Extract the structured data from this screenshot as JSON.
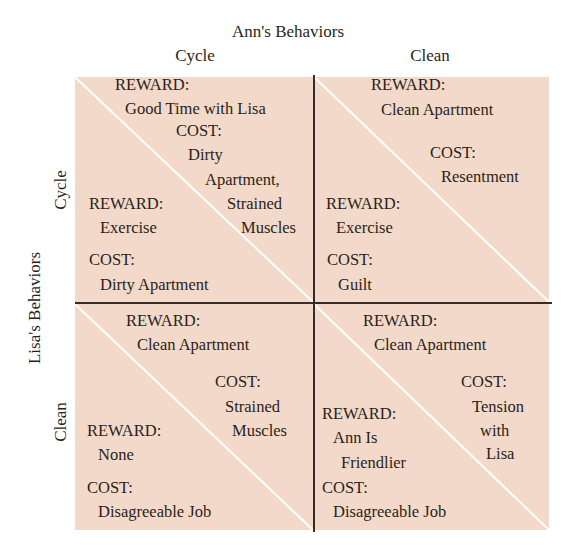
{
  "title": "Ann's Behaviors",
  "columns": [
    "Cycle",
    "Clean"
  ],
  "row_axis_title": "Lisa's Behaviors",
  "rows": [
    "Cycle",
    "Clean"
  ],
  "colors": {
    "cell_background": "#f3d9c9",
    "grid_line": "#3a2c25",
    "diagonal": "#ffffff",
    "text": "#2a1f1a"
  },
  "cells": {
    "cycle_cycle": {
      "ann": {
        "reward_label": "REWARD:",
        "reward": "Good Time with Lisa",
        "cost_label": "COST:",
        "cost_lines": [
          "Dirty",
          "Apartment,",
          "Strained",
          "Muscles"
        ]
      },
      "lisa": {
        "reward_label": "REWARD:",
        "reward": "Exercise",
        "cost_label": "COST:",
        "cost": "Dirty Apartment"
      }
    },
    "cycle_clean": {
      "ann": {
        "reward_label": "REWARD:",
        "reward": "Clean Apartment",
        "cost_label": "COST:",
        "cost": "Resentment"
      },
      "lisa": {
        "reward_label": "REWARD:",
        "reward": "Exercise",
        "cost_label": "COST:",
        "cost": "Guilt"
      }
    },
    "clean_cycle": {
      "ann": {
        "reward_label": "REWARD:",
        "reward": "Clean Apartment",
        "cost_label": "COST:",
        "cost_lines": [
          "Strained",
          "Muscles"
        ]
      },
      "lisa": {
        "reward_label": "REWARD:",
        "reward": "None",
        "cost_label": "COST:",
        "cost": "Disagreeable Job"
      }
    },
    "clean_clean": {
      "ann": {
        "reward_label": "REWARD:",
        "reward": "Clean Apartment",
        "cost_label": "COST:",
        "cost_lines": [
          "Tension",
          "with",
          "Lisa"
        ]
      },
      "lisa": {
        "reward_label": "REWARD:",
        "reward_lines": [
          "Ann Is",
          "Friendlier"
        ],
        "cost_label": "COST:",
        "cost": "Disagreeable Job"
      }
    }
  }
}
